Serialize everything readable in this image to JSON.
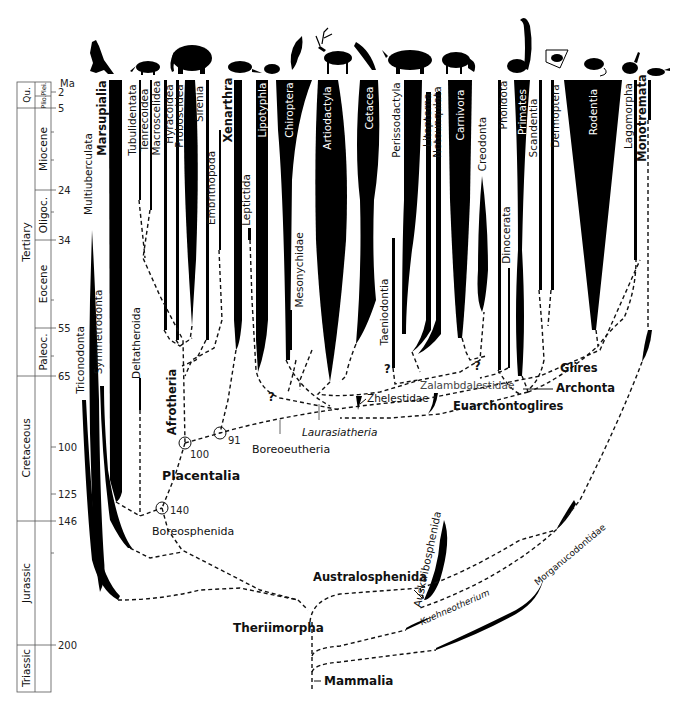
{
  "timescale": {
    "unit": "Ma",
    "ticks": [
      {
        "label": "2",
        "y": 92
      },
      {
        "label": "5",
        "y": 108
      },
      {
        "label": "24",
        "y": 190
      },
      {
        "label": "34",
        "y": 240
      },
      {
        "label": "55",
        "y": 328
      },
      {
        "label": "65",
        "y": 376
      },
      {
        "label": "100",
        "y": 447
      },
      {
        "label": "125",
        "y": 494
      },
      {
        "label": "146",
        "y": 521
      },
      {
        "label": "200",
        "y": 645
      }
    ],
    "eras": [
      {
        "label": "Qu.",
        "top": 82,
        "bottom": 108
      },
      {
        "label": "Tertiary",
        "top": 108,
        "bottom": 376
      },
      {
        "label": "Cretaceous",
        "top": 376,
        "bottom": 521
      },
      {
        "label": "Jurassic",
        "top": 521,
        "bottom": 645
      },
      {
        "label": "Triassic",
        "top": 645,
        "bottom": 692
      }
    ],
    "epochs": [
      {
        "label": "Plei.",
        "top": 82,
        "bottom": 96
      },
      {
        "label": "Plio.",
        "top": 96,
        "bottom": 108
      },
      {
        "label": "Miocene",
        "top": 108,
        "bottom": 190
      },
      {
        "label": "Oligoc.",
        "top": 190,
        "bottom": 240
      },
      {
        "label": "Eocene",
        "top": 240,
        "bottom": 328
      },
      {
        "label": "Paleoc.",
        "top": 328,
        "bottom": 376
      }
    ]
  },
  "silhouettes": [
    "kangaroo-icon",
    "aardvark-icon",
    "elephant-icon",
    "armadillo-icon",
    "hedgehog-icon",
    "bat-icon",
    "deer-icon",
    "dolphin-icon",
    "rhinoceros-icon",
    "fox-icon",
    "lemur-icon",
    "colugo-icon",
    "rat-icon",
    "rabbit-icon",
    "platypus-icon"
  ],
  "taxa": {
    "marsupialia": "Marsupialia",
    "multituberculata": "Multiuberculata",
    "symmetrodonta": "Symmetrodonta",
    "triconodonta": "Triconodonta",
    "deltatheroida": "Deltatheroida",
    "tubulidentata": "Tubulidentata",
    "tenrecoidea": "Tenrecoidea",
    "macroscelidea": "Macroscelidea",
    "hyracoidea": "Hyracoidea",
    "proboscidea": "Proboscidea",
    "sirenia": "Sirenia",
    "embrithopoda": "Embrithopoda",
    "xenarthra": "Xenarthra",
    "leptictida": "Leptictida",
    "lipotyphla": "Lipotyphla",
    "chiroptera": "Chiroptera",
    "mesonychidae": "Mesonychidae",
    "artiodactyla": "Artiodactyla",
    "cetacea": "Cetacea",
    "taeniodontia": "Taeniodontia",
    "perissodactyla": "Perissodactyla",
    "litopterna": "Litopterna",
    "notoungulata": "Notounqulata",
    "carnivora": "Carnivora",
    "creodonta": "Creodonta",
    "pholidota": "Pholidota",
    "dinocerata": "Dinocerata",
    "primates": "Primates",
    "scandentia": "Scandentia",
    "dermoptera": "Dermoptera",
    "rodentia": "Rodentia",
    "lagomorpha": "Lagomorpha",
    "monotremata": "Monotremata",
    "zhelestidae": "Zhelestidae",
    "zalambdalestidae": "Zalambdalestidae",
    "ausktribosphenida": "Ausktribosphenida",
    "kuehneotherium": "Kuehneotherium",
    "morganucodontidae": "Morganucodontidae"
  },
  "clades": {
    "afrotheria": "Afrotheria",
    "placentalia": "Placentalia",
    "boreosphenida": "Boreosphenida",
    "boreoeutheria": "Boreoeutheria",
    "laurasiatheria": "Laurasiatheria",
    "euarchontoglires": "Euarchontoglires",
    "glires": "Glires",
    "archonta": "Archonta",
    "australosphenida": "Australosphenida",
    "theriimorpha": "Theriimorpha",
    "mammalia": "Mammalia"
  },
  "nodes": [
    {
      "label": "100",
      "x": 185,
      "y": 443
    },
    {
      "label": "91",
      "x": 220,
      "y": 433
    },
    {
      "label": "140",
      "x": 162,
      "y": 508
    }
  ],
  "uncertain_marker": "?"
}
